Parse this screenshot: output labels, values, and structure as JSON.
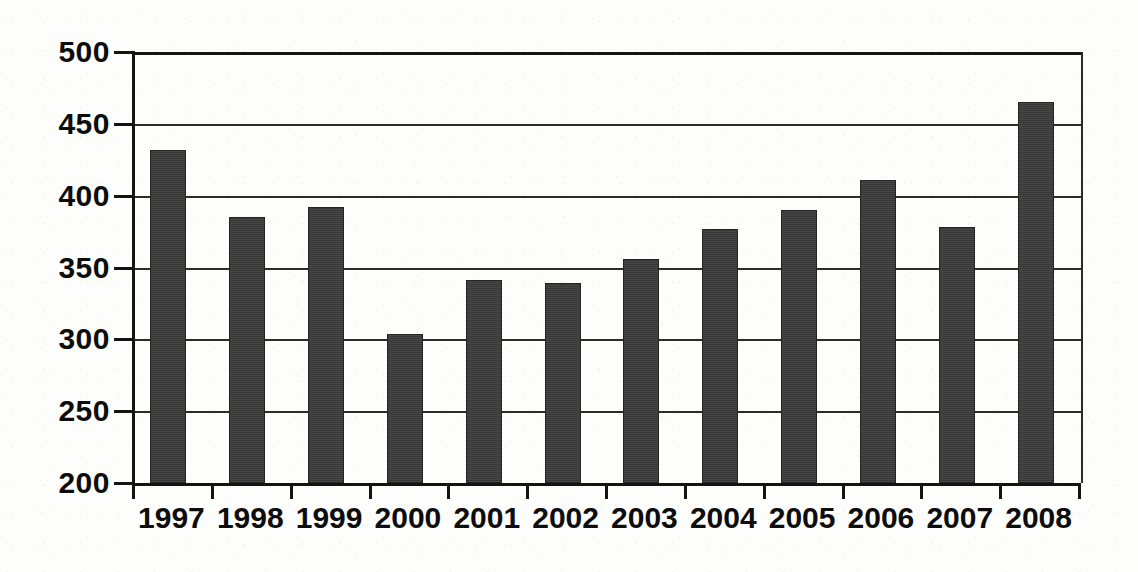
{
  "chart_data": {
    "type": "bar",
    "title": "",
    "subtitle": "",
    "xlabel": "",
    "ylabel": "",
    "categories": [
      "1997",
      "1998",
      "1999",
      "2000",
      "2001",
      "2002",
      "2003",
      "2004",
      "2005",
      "2006",
      "2007",
      "2008"
    ],
    "values": [
      432,
      385,
      392,
      304,
      341,
      339,
      356,
      377,
      390,
      411,
      378,
      465
    ],
    "series": [
      {
        "name": "",
        "values": [
          432,
          385,
          392,
          304,
          341,
          339,
          356,
          377,
          390,
          411,
          378,
          465
        ]
      }
    ],
    "ylim": [
      200,
      500
    ],
    "yticks": [
      200,
      250,
      300,
      350,
      400,
      450,
      500
    ],
    "ytick_labels": [
      "200",
      "250",
      "300",
      "350",
      "400",
      "450",
      "500"
    ],
    "grid": "horizontal",
    "legend": "none",
    "bar_color": "#3c3c3c",
    "axis_color": "#141414",
    "gridline_color": "#2b2b2b",
    "background_color": "#fdfdfc",
    "annotations": []
  }
}
